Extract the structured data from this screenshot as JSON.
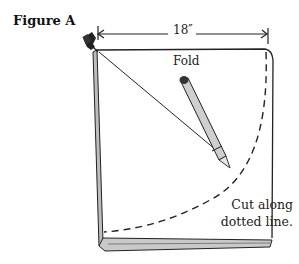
{
  "figure": {
    "title": "Figure A",
    "dimension_label": "18″",
    "fold_label": "Fold",
    "instruction_line1": "Cut along",
    "instruction_line2": "dotted line."
  },
  "elements": {
    "pushpin": "pushpin-icon",
    "pencil": "pencil-icon",
    "string": "string-line",
    "arc": "dashed-quarter-circle"
  },
  "colors": {
    "ink": "#222222",
    "paper_edge_fill": "#bdbdbd",
    "background": "#ffffff"
  }
}
